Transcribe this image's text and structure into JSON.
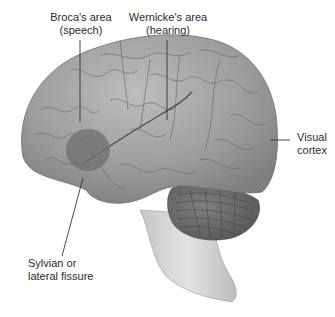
{
  "figure": {
    "labels": {
      "broca": {
        "line1": "Broca's area",
        "line2": "(speech)"
      },
      "wernicke": {
        "line1": "Wernicke's area",
        "line2": "(hearing)"
      },
      "visual": {
        "line1": "Visual",
        "line2": "cortex"
      },
      "sylvian": {
        "line1": "Sylvian or",
        "line2": "lateral fissure"
      }
    },
    "colors": {
      "brain_fill": "#9a9a9a",
      "brain_light": "#b8b8b8",
      "broca_region": "#6e6e6e",
      "cerebellum": "#6a6a6a",
      "brainstem": "#d0d0d0",
      "leader_line": "#333333",
      "text": "#2a2a2a"
    }
  }
}
